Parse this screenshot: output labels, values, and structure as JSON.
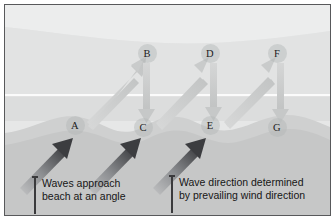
{
  "figure": {
    "border_color": "#58595b"
  },
  "palette": {
    "sky_band": "#e9eaea",
    "sea_far": "#dfe0e0",
    "sea_near": "#d8d9d9",
    "surf_line": "#fbfbfb",
    "beach_upper": "#cfd0d0",
    "beach_lower": "#c3c4c4",
    "marker_fill": "#b2b5b6",
    "light_arrow": "#c9cbcb",
    "dark_arrow_head": "#3c3d40",
    "dark_arrow_tail": "#b9babb",
    "text": "#161616"
  },
  "markers": [
    {
      "label": "A",
      "x": 74,
      "y": 124,
      "row": "beach"
    },
    {
      "label": "B",
      "x": 146,
      "y": 52,
      "row": "sea"
    },
    {
      "label": "C",
      "x": 142,
      "y": 126,
      "row": "beach"
    },
    {
      "label": "D",
      "x": 209,
      "y": 52,
      "row": "sea"
    },
    {
      "label": "E",
      "x": 209,
      "y": 124,
      "row": "beach"
    },
    {
      "label": "F",
      "x": 276,
      "y": 52,
      "row": "sea"
    },
    {
      "label": "G",
      "x": 276,
      "y": 126,
      "row": "beach"
    }
  ],
  "swash_arrows": [
    {
      "from": "A",
      "to": "B",
      "kind": "diagonal-up-right"
    },
    {
      "from": "C",
      "to": "D",
      "kind": "diagonal-up-right"
    },
    {
      "from": "E",
      "to": "F",
      "kind": "diagonal-up-right"
    }
  ],
  "backwash_arrows": [
    {
      "from": "B",
      "to": "C",
      "kind": "vertical-down"
    },
    {
      "from": "D",
      "to": "E",
      "kind": "vertical-down"
    },
    {
      "from": "F",
      "to": "G",
      "kind": "vertical-down"
    }
  ],
  "wave_arrows": [
    {
      "index": 1,
      "kind": "diagonal-up-right",
      "tail_x": 22,
      "tail_y": 183,
      "head_x": 66,
      "head_y": 141
    },
    {
      "index": 2,
      "kind": "diagonal-up-right",
      "tail_x": 90,
      "tail_y": 183,
      "head_x": 134,
      "head_y": 141
    },
    {
      "index": 3,
      "kind": "diagonal-up-right",
      "tail_x": 155,
      "tail_y": 183,
      "head_x": 199,
      "head_y": 141
    }
  ],
  "captions": [
    {
      "id": "waves-approach",
      "line1": "Waves approach",
      "line2": "beach at an angle",
      "x": 31,
      "y": 173
    },
    {
      "id": "wave-direction",
      "line1": "Wave direction determined",
      "line2": "by prevailing wind direction",
      "x": 168,
      "y": 172
    }
  ]
}
